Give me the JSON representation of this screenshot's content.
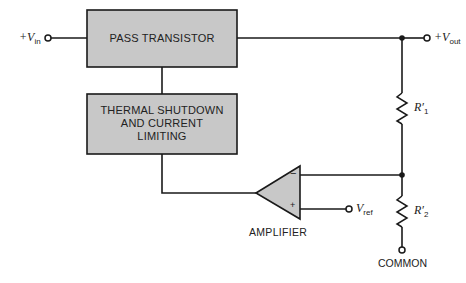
{
  "diagram": {
    "type": "voltage regulator block diagram",
    "colors": {
      "block_fill": "#c8c8c8",
      "line": "#1a1a1a",
      "background": "#ffffff"
    },
    "blocks": {
      "pass_transistor": "PASS TRANSISTOR",
      "thermal_line1": "THERMAL SHUTDOWN",
      "thermal_line2": "AND CURRENT",
      "thermal_line3": "LIMITING"
    },
    "amplifier": {
      "label": "AMPLIFIER",
      "inverting": "−",
      "noninverting": "+"
    },
    "terminals": {
      "vin_prefix": "+V",
      "vin_sub": "in",
      "vout_prefix": "+V",
      "vout_sub": "out",
      "vref_prefix": "V",
      "vref_sub": "ref",
      "common": "COMMON"
    },
    "resistors": {
      "r1_main": "R′",
      "r1_sub": "1",
      "r2_main": "R′",
      "r2_sub": "2"
    }
  }
}
